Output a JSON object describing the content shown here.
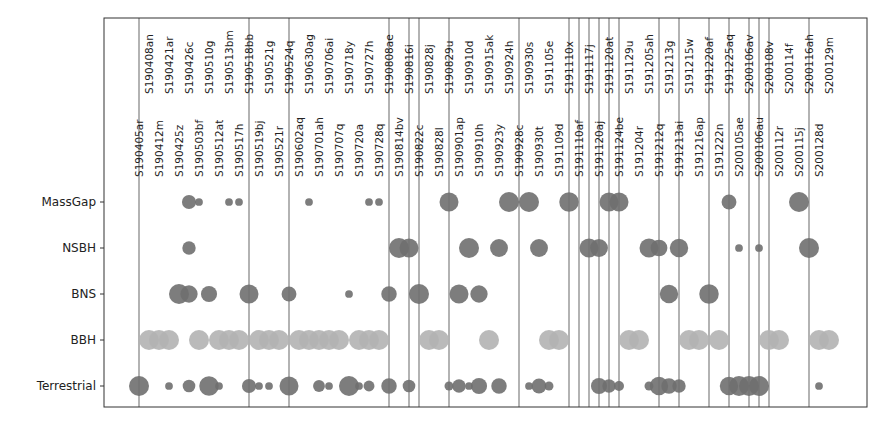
{
  "chart_data": {
    "type": "scatter",
    "title": "",
    "xlabel": "",
    "ylabel": "",
    "grid": false,
    "legend": null,
    "note": "Bubble chart of candidate event classification; circle size ~ probability; vertical lines mark retracted/highlighted events; BBH shown in light grey, others in dark grey",
    "categories_y": [
      "MassGap",
      "NSBH",
      "BNS",
      "BBH",
      "Terrestrial"
    ],
    "events": [
      "S190405ar",
      "S190408an",
      "S190412m",
      "S190421ar",
      "S190425z",
      "S190426c",
      "S190503bf",
      "S190510g",
      "S190512at",
      "S190513bm",
      "S190517h",
      "S190518bb",
      "S190519bj",
      "S190521g",
      "S190521r",
      "S190524q",
      "S190602aq",
      "S190630ag",
      "S190701ah",
      "S190706ai",
      "S190707q",
      "S190718y",
      "S190720a",
      "S190727h",
      "S190728q",
      "S190808ae",
      "S190814bv",
      "S190816i",
      "S190822c",
      "S190828j",
      "S190828l",
      "S190829u",
      "S190901ap",
      "S190910d",
      "S190910h",
      "S190915ak",
      "S190923y",
      "S190924h",
      "S190928c",
      "S190930s",
      "S190930t",
      "S191105e",
      "S191109d",
      "S191110x",
      "S191110af",
      "S191117j",
      "S191120aj",
      "S191120at",
      "S191124be",
      "S191129u",
      "S191204r",
      "S191205ah",
      "S191212q",
      "S191213g",
      "S191213ai",
      "S191215w",
      "S191216ap",
      "S191220af",
      "S191222n",
      "S191225aq",
      "S200105ae",
      "S200106av",
      "S200106au",
      "S200108v",
      "S200112r",
      "S200114f",
      "S200115j",
      "S200116ah",
      "S200128d",
      "S200129m"
    ],
    "vertical_lines": [
      0,
      11,
      15,
      25,
      27,
      28,
      31,
      38,
      43,
      44,
      45,
      46,
      47,
      48,
      52,
      54,
      57,
      59,
      61,
      62,
      63,
      67
    ],
    "points": {
      "MassGap": [
        [
          5,
          0.5
        ],
        [
          6,
          0.15
        ],
        [
          9,
          0.15
        ],
        [
          10,
          0.15
        ],
        [
          17,
          0.15
        ],
        [
          23,
          0.15
        ],
        [
          24,
          0.15
        ],
        [
          31,
          0.9
        ],
        [
          37,
          1.0
        ],
        [
          39,
          1.0
        ],
        [
          43,
          0.95
        ],
        [
          47,
          0.9
        ],
        [
          48,
          0.9
        ],
        [
          59,
          0.55
        ],
        [
          66,
          1.0
        ]
      ],
      "NSBH": [
        [
          5,
          0.45
        ],
        [
          26,
          1.0
        ],
        [
          27,
          0.9
        ],
        [
          33,
          1.0
        ],
        [
          36,
          0.8
        ],
        [
          40,
          0.8
        ],
        [
          45,
          0.9
        ],
        [
          46,
          0.8
        ],
        [
          51,
          0.9
        ],
        [
          52,
          0.7
        ],
        [
          54,
          0.85
        ],
        [
          60,
          0.15
        ],
        [
          62,
          0.15
        ],
        [
          67,
          1.0
        ]
      ],
      "BNS": [
        [
          4,
          1.0
        ],
        [
          5,
          0.75
        ],
        [
          7,
          0.65
        ],
        [
          11,
          0.9
        ],
        [
          15,
          0.55
        ],
        [
          21,
          0.15
        ],
        [
          25,
          0.6
        ],
        [
          28,
          1.0
        ],
        [
          32,
          0.9
        ],
        [
          34,
          0.75
        ],
        [
          53,
          0.85
        ],
        [
          57,
          0.95
        ]
      ],
      "BBH": [
        [
          1,
          1
        ],
        [
          2,
          1
        ],
        [
          3,
          1
        ],
        [
          6,
          1
        ],
        [
          8,
          1
        ],
        [
          9,
          1
        ],
        [
          10,
          1
        ],
        [
          12,
          1
        ],
        [
          13,
          1
        ],
        [
          14,
          1
        ],
        [
          16,
          1
        ],
        [
          17,
          1
        ],
        [
          18,
          1
        ],
        [
          19,
          1
        ],
        [
          20,
          1
        ],
        [
          22,
          1
        ],
        [
          23,
          1
        ],
        [
          24,
          1
        ],
        [
          29,
          1
        ],
        [
          30,
          1
        ],
        [
          35,
          1
        ],
        [
          41,
          1
        ],
        [
          42,
          1
        ],
        [
          49,
          1
        ],
        [
          50,
          1
        ],
        [
          55,
          1
        ],
        [
          56,
          1
        ],
        [
          58,
          1
        ],
        [
          63,
          1
        ],
        [
          64,
          1
        ],
        [
          68,
          1
        ],
        [
          69,
          1
        ]
      ],
      "Terrestrial": [
        [
          0,
          1.0
        ],
        [
          3,
          0.15
        ],
        [
          5,
          0.4
        ],
        [
          7,
          0.95
        ],
        [
          8,
          0.15
        ],
        [
          11,
          0.5
        ],
        [
          12,
          0.15
        ],
        [
          13,
          0.15
        ],
        [
          15,
          0.9
        ],
        [
          18,
          0.35
        ],
        [
          19,
          0.15
        ],
        [
          21,
          1.0
        ],
        [
          22,
          0.15
        ],
        [
          23,
          0.3
        ],
        [
          25,
          0.6
        ],
        [
          27,
          0.4
        ],
        [
          31,
          0.2
        ],
        [
          32,
          0.45
        ],
        [
          33,
          0.15
        ],
        [
          34,
          0.65
        ],
        [
          36,
          0.6
        ],
        [
          39,
          0.15
        ],
        [
          40,
          0.55
        ],
        [
          41,
          0.2
        ],
        [
          46,
          0.65
        ],
        [
          47,
          0.45
        ],
        [
          48,
          0.25
        ],
        [
          51,
          0.2
        ],
        [
          52,
          0.85
        ],
        [
          53,
          0.6
        ],
        [
          54,
          0.45
        ],
        [
          59,
          0.85
        ],
        [
          60,
          1.0
        ],
        [
          61,
          1.0
        ],
        [
          62,
          1.0
        ],
        [
          63,
          0.0
        ],
        [
          68,
          0.15
        ]
      ]
    },
    "colors": {
      "dark_marker": "#6f6f6f",
      "bbh_marker": "#b2b2b2",
      "vertical_line": "#8a8a8a",
      "axes": "#333333"
    }
  }
}
